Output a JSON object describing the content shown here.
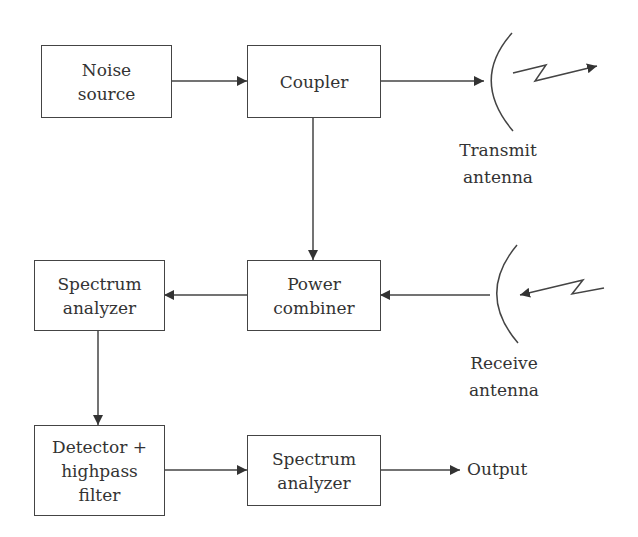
{
  "diagram": {
    "blocks": {
      "noise_source": {
        "lines": [
          "Noise",
          "source"
        ]
      },
      "coupler": {
        "lines": [
          "Coupler"
        ]
      },
      "power_combiner": {
        "lines": [
          "Power",
          "combiner"
        ]
      },
      "spectrum_analyzer_1": {
        "lines": [
          "Spectrum",
          "analyzer"
        ]
      },
      "detector_filter": {
        "lines": [
          "Detector +",
          "highpass",
          "filter"
        ]
      },
      "spectrum_analyzer_2": {
        "lines": [
          "Spectrum",
          "analyzer"
        ]
      }
    },
    "antennas": {
      "transmit": {
        "lines": [
          "Transmit",
          "antenna"
        ]
      },
      "receive": {
        "lines": [
          "Receive",
          "antenna"
        ]
      }
    },
    "output_label": "Output",
    "connections": [
      {
        "from": "Noise source",
        "to": "Coupler"
      },
      {
        "from": "Coupler",
        "to": "Transmit antenna"
      },
      {
        "from": "Coupler",
        "to": "Power combiner"
      },
      {
        "from": "Receive antenna",
        "to": "Power combiner"
      },
      {
        "from": "Power combiner",
        "to": "Spectrum analyzer"
      },
      {
        "from": "Spectrum analyzer",
        "to": "Detector + highpass filter"
      },
      {
        "from": "Detector + highpass filter",
        "to": "Spectrum analyzer"
      },
      {
        "from": "Spectrum analyzer",
        "to": "Output"
      }
    ],
    "colors": {
      "stroke": "#444444",
      "text": "#333333",
      "background": "#ffffff"
    }
  }
}
